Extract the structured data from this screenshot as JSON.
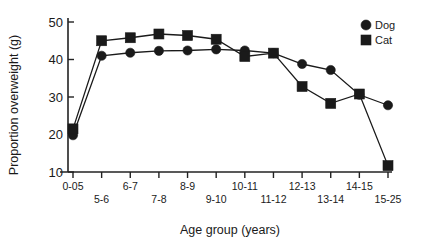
{
  "chart_data": {
    "type": "line",
    "title": "",
    "xlabel": "Age group (years)",
    "ylabel": "Proportion overweight (g)",
    "categories": [
      "0-05",
      "5-6",
      "6-7",
      "7-8",
      "8-9",
      "9-10",
      "10-11",
      "11-12",
      "12-13",
      "13-14",
      "14-15",
      "15-25"
    ],
    "series": [
      {
        "name": "Dog",
        "marker": "circle",
        "color": "#1a1a1a",
        "values": [
          19.8,
          41.0,
          41.8,
          42.3,
          42.4,
          42.7,
          42.4,
          41.7,
          38.8,
          37.2,
          30.6,
          27.8
        ]
      },
      {
        "name": "Cat",
        "marker": "square",
        "color": "#1a1a1a",
        "values": [
          21.5,
          45.0,
          45.8,
          46.8,
          46.4,
          45.4,
          40.8,
          41.7,
          32.8,
          28.3,
          30.8,
          11.7
        ]
      }
    ],
    "ylim": [
      10,
      50
    ],
    "yticks": [
      10,
      20,
      30,
      40,
      50
    ],
    "ytick_labels": [
      "10",
      "20",
      "30",
      "40",
      "50"
    ],
    "grid": false,
    "legend_position": "top-right",
    "legend_entries": [
      "Dog",
      "Cat"
    ]
  },
  "axes": {
    "y_title": "Proportion overweight (g)",
    "x_title": "Age group (years)"
  },
  "legend": {
    "dog_label": "Dog",
    "cat_label": "Cat"
  }
}
